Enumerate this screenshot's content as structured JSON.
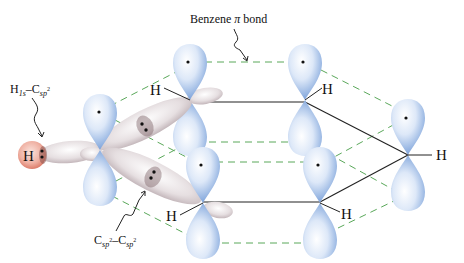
{
  "diagram": {
    "labels": {
      "benzene_pi_bond": {
        "main": "Benzene ",
        "symbol": "π",
        "tail": " bond"
      },
      "h1s_csp2": {
        "h": "H",
        "h_sub": "1s",
        "dash": "–",
        "c": "C",
        "c_sub": "sp",
        "c_sup": "2"
      },
      "csp2_csp2": {
        "c1": "C",
        "c1_sub": "sp",
        "c1_sup": "2",
        "dash": "–",
        "c2": "C",
        "c2_sub": "sp",
        "c2_sup": "2"
      }
    },
    "atoms": {
      "hydrogen_sphere_label": "H",
      "hydrogen_labels": [
        "H",
        "H",
        "H",
        "H",
        "H"
      ]
    },
    "colors": {
      "p_orbital": "#8fb0e0",
      "p_orbital_light": "#f2f6fd",
      "sp2_orbital": "#cfc3c6",
      "sp2_orbital_light": "#f5f1f2",
      "h_sphere": "#e58c7a",
      "pi_dashed": "#5aa85a",
      "sigma_line": "#222222"
    }
  }
}
